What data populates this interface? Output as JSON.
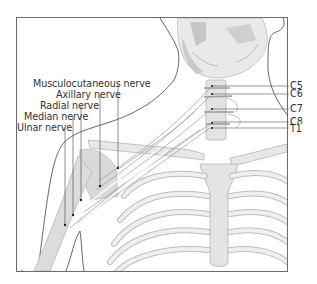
{
  "figure": {
    "colors": {
      "frame": "#6b6b6b",
      "outline": "#555555",
      "bone_fill": "#e6e6e6",
      "bone_stroke": "#b8b8b8",
      "shade": "#c9c9c9",
      "nerve": "#f4f4f4",
      "leader": "#444444",
      "text": "#333333"
    },
    "nerve_labels": [
      {
        "id": "musculocutaneous",
        "text": "Musculocutaneous nerve",
        "x": 33,
        "y": 79,
        "anchor_x": 118,
        "target_y": 168
      },
      {
        "id": "axillary",
        "text": "Axillary nerve",
        "x": 56,
        "y": 90,
        "anchor_x": 100,
        "target_y": 186
      },
      {
        "id": "radial",
        "text": "Radial nerve",
        "x": 40,
        "y": 101,
        "anchor_x": 81,
        "target_y": 200
      },
      {
        "id": "median",
        "text": "Median nerve",
        "x": 24,
        "y": 112,
        "anchor_x": 73,
        "target_y": 215
      },
      {
        "id": "ulnar",
        "text": "Ulnar nerve",
        "x": 17,
        "y": 123,
        "anchor_x": 65,
        "target_y": 225
      }
    ],
    "spinal_labels": [
      {
        "id": "c5",
        "text": "C5",
        "y": 86,
        "dot_x": 212
      },
      {
        "id": "c6",
        "text": "C6",
        "y": 94,
        "dot_x": 212
      },
      {
        "id": "c7",
        "text": "C7",
        "y": 109,
        "dot_x": 212
      },
      {
        "id": "c8",
        "text": "C8",
        "y": 122,
        "dot_x": 212
      },
      {
        "id": "t1",
        "text": "T1",
        "y": 128,
        "dot_x": 212
      }
    ]
  }
}
